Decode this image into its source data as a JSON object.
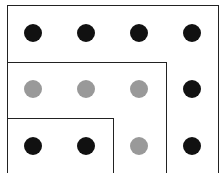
{
  "diagram": {
    "colors": {
      "black": "#111111",
      "gray": "#999999",
      "line": "#222222"
    },
    "boxes": [
      {
        "name": "outer-box",
        "left": 7,
        "top": 5,
        "right": 219
      },
      {
        "name": "middle-box",
        "left": 7,
        "top": 62,
        "right": 167
      },
      {
        "name": "inner-box",
        "left": 7,
        "top": 118,
        "right": 114
      }
    ],
    "columns_x": [
      33,
      86,
      139,
      192
    ],
    "rows_y": [
      33,
      89,
      146
    ],
    "dots": [
      [
        "black",
        "black",
        "black",
        "black"
      ],
      [
        "gray",
        "gray",
        "gray",
        "black"
      ],
      [
        "black",
        "black",
        "gray",
        "black"
      ]
    ]
  }
}
